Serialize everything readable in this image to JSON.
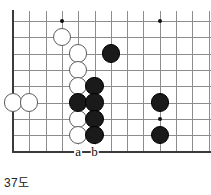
{
  "diagram": {
    "caption": "37도",
    "type": "go-board-diagram",
    "board": {
      "origin_x": 13,
      "origin_y": 21,
      "step": 16.3,
      "cols": 12,
      "rows": 9,
      "line_color": "#8d8d8d",
      "edge_color": "#3a3a3a",
      "background": "#ffffff"
    },
    "star_points": [
      {
        "col": 3,
        "row": 0
      },
      {
        "col": 9,
        "row": 0
      },
      {
        "col": 9,
        "row": 6
      }
    ],
    "stones": [
      {
        "color": "white",
        "col": 3,
        "row": 1
      },
      {
        "color": "white",
        "col": 4,
        "row": 2
      },
      {
        "color": "white",
        "col": 4,
        "row": 3
      },
      {
        "color": "white",
        "col": 4,
        "row": 4
      },
      {
        "color": "white",
        "col": 0,
        "row": 5
      },
      {
        "color": "white",
        "col": 1,
        "row": 5
      },
      {
        "color": "white",
        "col": 4,
        "row": 6
      },
      {
        "color": "white",
        "col": 4,
        "row": 7
      },
      {
        "color": "black",
        "col": 6,
        "row": 2
      },
      {
        "color": "black",
        "col": 5,
        "row": 4
      },
      {
        "color": "black",
        "col": 4,
        "row": 5
      },
      {
        "color": "black",
        "col": 5,
        "row": 5
      },
      {
        "color": "black",
        "col": 5,
        "row": 6
      },
      {
        "color": "black",
        "col": 5,
        "row": 7
      },
      {
        "color": "black",
        "col": 9,
        "row": 5
      },
      {
        "color": "black",
        "col": 9,
        "row": 7
      }
    ],
    "point_labels": [
      {
        "text": "a",
        "col": 4,
        "row": 8
      },
      {
        "text": "b",
        "col": 5,
        "row": 8
      }
    ],
    "stone_radius": 9.2,
    "colors": {
      "black_stone": "#1a1a1a",
      "white_stone": "#ffffff",
      "white_stone_border": "#5d5d5d",
      "label_text": "#111111",
      "caption_text": "#222222"
    }
  }
}
